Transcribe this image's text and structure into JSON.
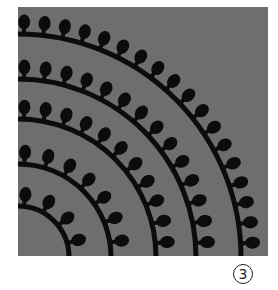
{
  "figure": {
    "label": "3",
    "background_color": "#ffffff",
    "panel_color": "#6e6e6e",
    "pattern_color": "#0c0c0c",
    "pattern": {
      "description": "concentric quarter-circle arcs with outward loop bumps",
      "center": [
        0,
        250
      ],
      "radii": [
        51,
        93,
        138,
        178,
        223
      ],
      "bump_spacing_px": 20
    }
  }
}
